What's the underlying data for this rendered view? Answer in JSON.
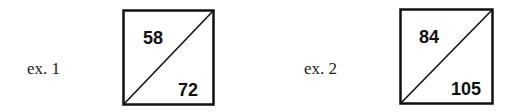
{
  "examples": [
    {
      "label": "ex. 1",
      "top": "58",
      "bottom": "72"
    },
    {
      "label": "ex. 2",
      "top": "84",
      "bottom": "105"
    }
  ]
}
